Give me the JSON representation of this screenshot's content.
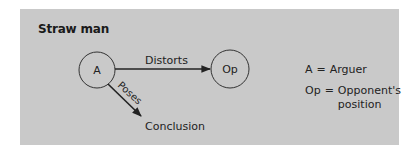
{
  "title": "Straw man",
  "nodes": {
    "arguer": {
      "label": "A"
    },
    "opponent": {
      "label": "Op"
    },
    "conclusion": {
      "label": "Conclusion"
    }
  },
  "edges": {
    "distorts": {
      "label": "Distorts",
      "from": "A",
      "to": "Op"
    },
    "poses": {
      "label": "Poses",
      "from": "A",
      "to": "Conclusion"
    }
  },
  "legend": [
    {
      "key": "A",
      "eq": "=",
      "value": "Arguer"
    },
    {
      "key": "Op",
      "eq": "=",
      "value": "Opponent's",
      "value2": "position"
    }
  ],
  "colors": {
    "panel": "#c9c9c9",
    "stroke": "#222222"
  }
}
